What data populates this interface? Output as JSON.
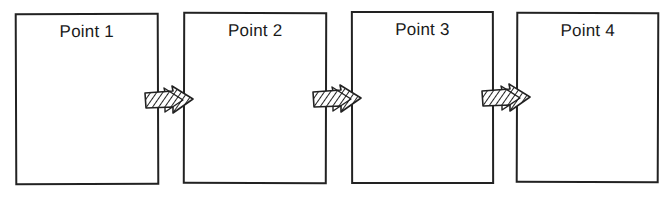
{
  "diagram": {
    "type": "sequential-flow",
    "stroke_color": "#222222",
    "background_color": "#ffffff",
    "boxes": [
      {
        "label": "Point 1"
      },
      {
        "label": "Point 2"
      },
      {
        "label": "Point 3"
      },
      {
        "label": "Point 4"
      }
    ],
    "arrows": [
      {
        "from": "Point 1",
        "to": "Point 2",
        "style": "hatched-double-arrow"
      },
      {
        "from": "Point 2",
        "to": "Point 3",
        "style": "hatched-double-arrow"
      },
      {
        "from": "Point 3",
        "to": "Point 4",
        "style": "hatched-double-arrow"
      }
    ]
  }
}
